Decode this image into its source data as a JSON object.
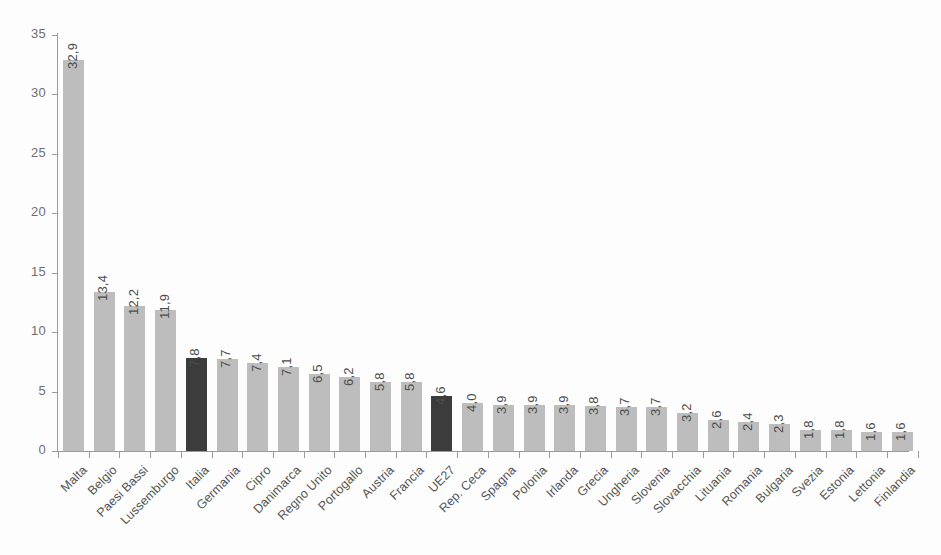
{
  "chart_data": {
    "type": "bar",
    "title": "",
    "subtitle": "",
    "xlabel": "",
    "ylabel": "",
    "ylim": [
      0,
      35
    ],
    "ytick_step": 5,
    "ytick_labels": [
      "0",
      "5",
      "10",
      "15",
      "20",
      "25",
      "30",
      "35"
    ],
    "grid": false,
    "legend": null,
    "decimal_separator": ",",
    "colors": {
      "bar_default": "#bdbdbd",
      "bar_highlight": "#3c3c3c",
      "axis": "#9a9a9a",
      "text": "#555555",
      "background": "#fdfdfd"
    },
    "categories": [
      "Malta",
      "Belgio",
      "Paesi Bassi",
      "Lussemburgo",
      "Italia",
      "Germania",
      "Cipro",
      "Danimarca",
      "Regno Unito",
      "Portogallo",
      "Austria",
      "Francia",
      "UE27",
      "Rep. Ceca",
      "Spagna",
      "Polonia",
      "Irlanda",
      "Grecia",
      "Ungheria",
      "Slovenia",
      "Slovacchia",
      "Lituania",
      "Romania",
      "Bulgaria",
      "Svezia",
      "Estonia",
      "Lettonia",
      "Finlandia"
    ],
    "values": [
      32.9,
      13.4,
      12.2,
      11.9,
      7.8,
      7.7,
      7.4,
      7.1,
      6.5,
      6.2,
      5.8,
      5.8,
      4.6,
      4.0,
      3.9,
      3.9,
      3.9,
      3.8,
      3.7,
      3.7,
      3.2,
      2.6,
      2.4,
      2.3,
      1.8,
      1.8,
      1.6,
      1.6
    ],
    "value_labels": [
      "32,9",
      "13,4",
      "12,2",
      "11,9",
      "7,8",
      "7,7",
      "7,4",
      "7,1",
      "6,5",
      "6,2",
      "5,8",
      "5,8",
      "4,6",
      "4,0",
      "3,9",
      "3,9",
      "3,9",
      "3,8",
      "3,7",
      "3,7",
      "3,2",
      "2,6",
      "2,4",
      "2,3",
      "1,8",
      "1,8",
      "1,6",
      "1,6"
    ],
    "highlighted": [
      "Italia",
      "UE27"
    ]
  }
}
